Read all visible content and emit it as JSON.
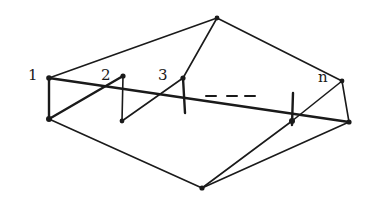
{
  "diagram": {
    "type": "graph",
    "labels": {
      "v1": "1",
      "v2": "2",
      "v3": "3",
      "vn": "n",
      "ellipsis": "- - -"
    },
    "nodes": [
      {
        "id": "top",
        "x": 217,
        "y": 18
      },
      {
        "id": "bottom",
        "x": 202,
        "y": 188
      },
      {
        "id": "1a",
        "x": 49,
        "y": 78
      },
      {
        "id": "1b",
        "x": 49,
        "y": 119
      },
      {
        "id": "2a",
        "x": 123,
        "y": 76
      },
      {
        "id": "2b",
        "x": 122,
        "y": 121
      },
      {
        "id": "3a",
        "x": 183,
        "y": 78
      },
      {
        "id": "3b",
        "x": 185,
        "y": 113
      },
      {
        "id": "na",
        "x": 342,
        "y": 81
      },
      {
        "id": "nb",
        "x": 349,
        "y": 122
      },
      {
        "id": "m",
        "x": 292,
        "y": 121
      }
    ],
    "colors": {
      "stroke": "#1a1a1a",
      "background": "#ffffff"
    }
  }
}
